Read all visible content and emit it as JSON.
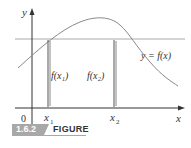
{
  "figure": {
    "number": "1.6.2",
    "label": "FIGURE"
  },
  "axes": {
    "x_label": "x",
    "y_label": "y",
    "origin_label": "0",
    "x_ticks": [
      "x1",
      "x2"
    ]
  },
  "labels": {
    "curve": "y = f(x)",
    "f_x1": "f(x₁)",
    "f_x2": "f(x₂)",
    "x1": "x",
    "x1_sub": "1",
    "x2": "x",
    "x2_sub": "2"
  },
  "colors": {
    "curve": "#888888",
    "axis": "#333333",
    "horizontal_line": "#aaaaaa",
    "caption_bg": "#a8a8a8"
  }
}
